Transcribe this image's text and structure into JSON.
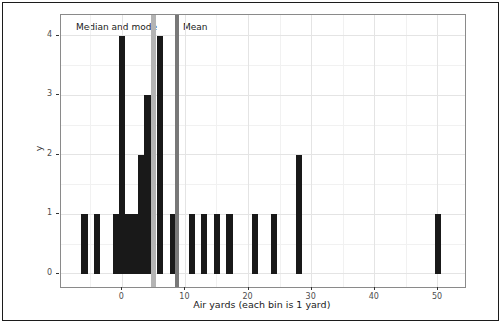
{
  "figure": {
    "annotations": {
      "median_label": "Median and mode",
      "mean_label": "Mean"
    },
    "x_axis_title": "Air yards (each bin is 1 yard)",
    "y_axis_title": "y"
  },
  "chart_data": {
    "type": "bar",
    "subtype": "histogram",
    "title": "",
    "xlabel": "Air yards (each bin is 1 yard)",
    "ylabel": "y",
    "binwidth": 1,
    "bins": [
      {
        "x": -6,
        "count": 1
      },
      {
        "x": -4,
        "count": 1
      },
      {
        "x": -1,
        "count": 1
      },
      {
        "x": 0,
        "count": 4
      },
      {
        "x": 1,
        "count": 1
      },
      {
        "x": 2,
        "count": 1
      },
      {
        "x": 3,
        "count": 2
      },
      {
        "x": 4,
        "count": 3
      },
      {
        "x": 6,
        "count": 4
      },
      {
        "x": 8,
        "count": 1
      },
      {
        "x": 11,
        "count": 1
      },
      {
        "x": 13,
        "count": 1
      },
      {
        "x": 15,
        "count": 1
      },
      {
        "x": 17,
        "count": 1
      },
      {
        "x": 21,
        "count": 1
      },
      {
        "x": 24,
        "count": 1
      },
      {
        "x": 28,
        "count": 2
      },
      {
        "x": 50,
        "count": 1
      }
    ],
    "reference_lines": [
      {
        "name": "median-mode-line",
        "label": "Median and mode",
        "x": 5,
        "color": "#b4b4b4",
        "width_px": 5
      },
      {
        "name": "mean-line",
        "label": "Mean",
        "x": 8.6,
        "color": "#787878",
        "width_px": 4
      }
    ],
    "bar_color": "#191919",
    "x_ticks": [
      0,
      10,
      20,
      30,
      40,
      50
    ],
    "y_ticks": [
      0,
      1,
      2,
      3,
      4
    ],
    "x_minor": [
      -5,
      5,
      15,
      25,
      35,
      45
    ],
    "y_minor": [
      0.5,
      1.5,
      2.5,
      3.5
    ],
    "xlim": [
      -9.7,
      54.2
    ],
    "ylim": [
      -0.21,
      4.35
    ],
    "grid": {
      "major_color": "#e4e4e4",
      "minor_color": "#f1f1f1",
      "grid_on": true
    },
    "legend": "none"
  }
}
